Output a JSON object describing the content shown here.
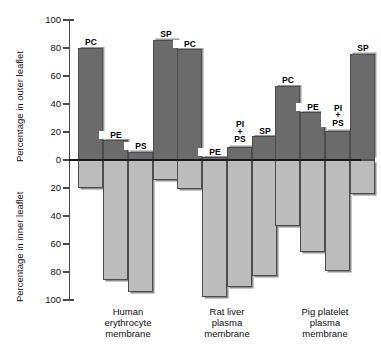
{
  "chart_data": {
    "type": "bar",
    "title": "",
    "orientation": "vertical-diverging",
    "ylabel_top": "Percentage in outer leaflet",
    "ylabel_bottom": "Percentage in inner leaflet",
    "xlabel": "",
    "grid": false,
    "legend": "none",
    "ylim_top": [
      0,
      100
    ],
    "ylim_bottom": [
      0,
      100
    ],
    "yticks_top": [
      "0",
      "20",
      "40",
      "60",
      "80",
      "100"
    ],
    "yticks_bottom": [
      "0",
      "20",
      "40",
      "60",
      "80",
      "100"
    ],
    "categories": [
      "Human erythrocyte membrane",
      "Rat liver plasma membrane",
      "Pig platelet plasma membrane"
    ],
    "groups": [
      {
        "name": "Human erythrocyte membrane",
        "label_lines": [
          "Human",
          "erythrocyte",
          "membrane"
        ],
        "bars": [
          {
            "lipid": "PC",
            "label_lines": [
              "PC"
            ],
            "outer": 80,
            "inner": 20
          },
          {
            "lipid": "PE",
            "label_lines": [
              "PE"
            ],
            "outer": 14,
            "inner": 86
          },
          {
            "lipid": "PS",
            "label_lines": [
              "PS"
            ],
            "outer": 6,
            "inner": 94
          },
          {
            "lipid": "SP",
            "label_lines": [
              "SP"
            ],
            "outer": 86,
            "inner": 14
          }
        ]
      },
      {
        "name": "Rat liver plasma membrane",
        "label_lines": [
          "Rat liver",
          "plasma",
          "membrane"
        ],
        "bars": [
          {
            "lipid": "PC",
            "label_lines": [
              "PC"
            ],
            "outer": 79,
            "inner": 21
          },
          {
            "lipid": "PE",
            "label_lines": [
              "PE"
            ],
            "outer": 2,
            "inner": 98
          },
          {
            "lipid": "PI + PS",
            "label_lines": [
              "PI",
              "+",
              "PS"
            ],
            "outer": 9,
            "inner": 91
          },
          {
            "lipid": "SP",
            "label_lines": [
              "SP"
            ],
            "outer": 17,
            "inner": 83
          }
        ]
      },
      {
        "name": "Pig platelet plasma membrane",
        "label_lines": [
          "Pig platelet",
          "plasma",
          "membrane"
        ],
        "bars": [
          {
            "lipid": "PC",
            "label_lines": [
              "PC"
            ],
            "outer": 53,
            "inner": 47
          },
          {
            "lipid": "PE",
            "label_lines": [
              "PE"
            ],
            "outer": 34,
            "inner": 66
          },
          {
            "lipid": "PI + PS",
            "label_lines": [
              "PI",
              "+",
              "PS"
            ],
            "outer": 21,
            "inner": 79
          },
          {
            "lipid": "SP",
            "label_lines": [
              "SP"
            ],
            "outer": 76,
            "inner": 24
          }
        ]
      }
    ],
    "colors": {
      "outer_bar": "#6b6b6b",
      "inner_bar": "#bcbcbc",
      "axis": "#4a4a4a",
      "zero_line": "#1a1a1a",
      "background": "#ffffff"
    }
  }
}
